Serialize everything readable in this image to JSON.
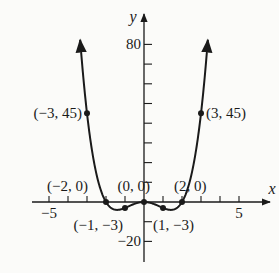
{
  "chart_data": {
    "type": "line",
    "title": "",
    "function": "y = x^4 - 4x^2",
    "xlabel": "x",
    "ylabel": "y",
    "xlim": [
      -5.5,
      6
    ],
    "ylim": [
      -25,
      90
    ],
    "x_ticks": [
      -5,
      -4,
      -3,
      -2,
      -1,
      1,
      2,
      3,
      4,
      5
    ],
    "x_tick_labels": [
      {
        "value": -5,
        "label": "−5"
      },
      {
        "value": 5,
        "label": "5"
      }
    ],
    "y_ticks": [
      -20,
      -10,
      10,
      20,
      30,
      40,
      50,
      60,
      70,
      80
    ],
    "y_tick_labels": [
      {
        "value": 80,
        "label": "80"
      },
      {
        "value": -20,
        "label": "−20"
      }
    ],
    "grid": false,
    "legend": null,
    "points": [
      {
        "x": -3,
        "y": 45,
        "label": "(−3, 45)"
      },
      {
        "x": -2,
        "y": 0,
        "label": "(−2, 0)"
      },
      {
        "x": -1,
        "y": -3,
        "label": "(−1, −3)"
      },
      {
        "x": 0,
        "y": 0,
        "label": "(0, 0)"
      },
      {
        "x": 1,
        "y": -3,
        "label": "(1, −3)"
      },
      {
        "x": 2,
        "y": 0,
        "label": "(2, 0)"
      },
      {
        "x": 3,
        "y": 45,
        "label": "(3, 45)"
      }
    ],
    "series": [
      {
        "name": "f(x)",
        "x_range": [
          -3.36,
          3.36
        ],
        "ends_with_arrows": true
      }
    ]
  },
  "axes": {
    "x_name": "x",
    "y_name": "y"
  },
  "style": {
    "ink": "#1a1a1a",
    "background": "#fbfbf9"
  }
}
